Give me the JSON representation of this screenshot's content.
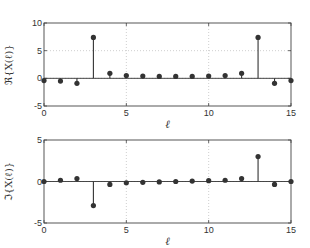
{
  "chart_data": [
    {
      "type": "stem",
      "title": "",
      "xlabel": "ℓ",
      "ylabel": "ℜ{X(ℓ)}",
      "xlim": [
        0,
        15
      ],
      "ylim": [
        -5,
        10
      ],
      "xticks": [
        0,
        5,
        10,
        15
      ],
      "yticks": [
        -5,
        0,
        5,
        10
      ],
      "grid": "dotted at major ticks",
      "x": [
        0,
        1,
        2,
        3,
        4,
        5,
        6,
        7,
        8,
        9,
        10,
        11,
        12,
        13,
        14,
        15
      ],
      "values": [
        -0.4,
        -0.5,
        -0.9,
        7.4,
        0.9,
        0.5,
        0.4,
        0.35,
        0.35,
        0.35,
        0.4,
        0.5,
        0.9,
        7.4,
        -0.9,
        -0.4
      ]
    },
    {
      "type": "stem",
      "title": "",
      "xlabel": "ℓ",
      "ylabel": "ℑ{X(ℓ)}",
      "xlim": [
        0,
        15
      ],
      "ylim": [
        -5,
        5
      ],
      "xticks": [
        0,
        5,
        10,
        15
      ],
      "yticks": [
        -5,
        0,
        5
      ],
      "grid": "dotted at major ticks",
      "x": [
        0,
        1,
        2,
        3,
        4,
        5,
        6,
        7,
        8,
        9,
        10,
        11,
        12,
        13,
        14,
        15
      ],
      "values": [
        0.0,
        0.15,
        0.35,
        -2.9,
        -0.35,
        -0.15,
        -0.1,
        -0.05,
        0.0,
        0.05,
        0.1,
        0.15,
        0.35,
        3.0,
        -0.35,
        0.0
      ]
    }
  ],
  "labels": {
    "top_ylabel": "ℜ{X(ℓ)}",
    "bottom_ylabel": "ℑ{X(ℓ)}",
    "xlabel": "ℓ"
  }
}
